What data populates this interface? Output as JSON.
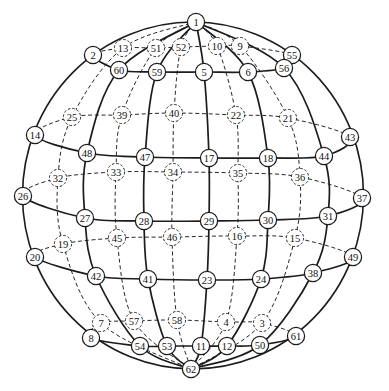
{
  "figure": {
    "type": "sphere-graph",
    "background": "#ffffff",
    "line_color": "#1c1c1c",
    "node_fill": "#ffffff",
    "outer_ellipse": {
      "cx": 193,
      "cy": 195.5,
      "rx": 170.5,
      "ry": 173.5
    },
    "north_pole": "1",
    "south_pole": "62",
    "nodes": [
      {
        "id": "1",
        "label": "1",
        "x": 196,
        "y": 22,
        "side": "front"
      },
      {
        "id": "2",
        "label": "2",
        "x": 93,
        "y": 55,
        "side": "front"
      },
      {
        "id": "3",
        "label": "3",
        "x": 262,
        "y": 323,
        "side": "back"
      },
      {
        "id": "4",
        "label": "4",
        "x": 226,
        "y": 322,
        "side": "back"
      },
      {
        "id": "5",
        "label": "5",
        "x": 204,
        "y": 72,
        "side": "front"
      },
      {
        "id": "6",
        "label": "6",
        "x": 248,
        "y": 72,
        "side": "front"
      },
      {
        "id": "7",
        "label": "7",
        "x": 101,
        "y": 323,
        "side": "back"
      },
      {
        "id": "8",
        "label": "8",
        "x": 91,
        "y": 338,
        "side": "front"
      },
      {
        "id": "9",
        "label": "9",
        "x": 240,
        "y": 46,
        "side": "back"
      },
      {
        "id": "10",
        "label": "10",
        "x": 217,
        "y": 46,
        "side": "back"
      },
      {
        "id": "11",
        "label": "11",
        "x": 201,
        "y": 346,
        "side": "front"
      },
      {
        "id": "12",
        "label": "12",
        "x": 227,
        "y": 346,
        "side": "front"
      },
      {
        "id": "13",
        "label": "13",
        "x": 123,
        "y": 48,
        "side": "back"
      },
      {
        "id": "14",
        "label": "14",
        "x": 35,
        "y": 135,
        "side": "front"
      },
      {
        "id": "15",
        "label": "15",
        "x": 295,
        "y": 238,
        "side": "back"
      },
      {
        "id": "16",
        "label": "16",
        "x": 237,
        "y": 236,
        "side": "back"
      },
      {
        "id": "17",
        "label": "17",
        "x": 209,
        "y": 158,
        "side": "front"
      },
      {
        "id": "18",
        "label": "18",
        "x": 268,
        "y": 158,
        "side": "front"
      },
      {
        "id": "19",
        "label": "19",
        "x": 63,
        "y": 244,
        "side": "back"
      },
      {
        "id": "20",
        "label": "20",
        "x": 35,
        "y": 257,
        "side": "front"
      },
      {
        "id": "21",
        "label": "21",
        "x": 288,
        "y": 118,
        "side": "back"
      },
      {
        "id": "22",
        "label": "22",
        "x": 236,
        "y": 115,
        "side": "back"
      },
      {
        "id": "23",
        "label": "23",
        "x": 207,
        "y": 280,
        "side": "front"
      },
      {
        "id": "24",
        "label": "24",
        "x": 261,
        "y": 279,
        "side": "front"
      },
      {
        "id": "25",
        "label": "25",
        "x": 72,
        "y": 117,
        "side": "back"
      },
      {
        "id": "26",
        "label": "26",
        "x": 23,
        "y": 196,
        "side": "front"
      },
      {
        "id": "27",
        "label": "27",
        "x": 85,
        "y": 218,
        "side": "front"
      },
      {
        "id": "28",
        "label": "28",
        "x": 144,
        "y": 221,
        "side": "front"
      },
      {
        "id": "29",
        "label": "29",
        "x": 209,
        "y": 221,
        "side": "front"
      },
      {
        "id": "30",
        "label": "30",
        "x": 268,
        "y": 220,
        "side": "front"
      },
      {
        "id": "31",
        "label": "31",
        "x": 328,
        "y": 216,
        "side": "front"
      },
      {
        "id": "32",
        "label": "32",
        "x": 58,
        "y": 178,
        "side": "back"
      },
      {
        "id": "33",
        "label": "33",
        "x": 116,
        "y": 172,
        "side": "back"
      },
      {
        "id": "34",
        "label": "34",
        "x": 173,
        "y": 172,
        "side": "back"
      },
      {
        "id": "35",
        "label": "35",
        "x": 238,
        "y": 173,
        "side": "back"
      },
      {
        "id": "36",
        "label": "36",
        "x": 300,
        "y": 177,
        "side": "back"
      },
      {
        "id": "37",
        "label": "37",
        "x": 362,
        "y": 198,
        "side": "front"
      },
      {
        "id": "38",
        "label": "38",
        "x": 313,
        "y": 273,
        "side": "front"
      },
      {
        "id": "39",
        "label": "39",
        "x": 122,
        "y": 115,
        "side": "back"
      },
      {
        "id": "40",
        "label": "40",
        "x": 174,
        "y": 113,
        "side": "back"
      },
      {
        "id": "41",
        "label": "41",
        "x": 148,
        "y": 279,
        "side": "front"
      },
      {
        "id": "42",
        "label": "42",
        "x": 96,
        "y": 276,
        "side": "front"
      },
      {
        "id": "43",
        "label": "43",
        "x": 350,
        "y": 137,
        "side": "front"
      },
      {
        "id": "44",
        "label": "44",
        "x": 324,
        "y": 156,
        "side": "front"
      },
      {
        "id": "45",
        "label": "45",
        "x": 117,
        "y": 238,
        "side": "back"
      },
      {
        "id": "46",
        "label": "46",
        "x": 172,
        "y": 237,
        "side": "back"
      },
      {
        "id": "47",
        "label": "47",
        "x": 145,
        "y": 157,
        "side": "front"
      },
      {
        "id": "48",
        "label": "48",
        "x": 87,
        "y": 153,
        "side": "front"
      },
      {
        "id": "49",
        "label": "49",
        "x": 353,
        "y": 257,
        "side": "front"
      },
      {
        "id": "50",
        "label": "50",
        "x": 260,
        "y": 345,
        "side": "front"
      },
      {
        "id": "51",
        "label": "51",
        "x": 156,
        "y": 48,
        "side": "back"
      },
      {
        "id": "52",
        "label": "52",
        "x": 181,
        "y": 47,
        "side": "back"
      },
      {
        "id": "53",
        "label": "53",
        "x": 167,
        "y": 346,
        "side": "front"
      },
      {
        "id": "54",
        "label": "54",
        "x": 140,
        "y": 346,
        "side": "front"
      },
      {
        "id": "55",
        "label": "55",
        "x": 292,
        "y": 55,
        "side": "front"
      },
      {
        "id": "56",
        "label": "56",
        "x": 284,
        "y": 68,
        "side": "front"
      },
      {
        "id": "57",
        "label": "57",
        "x": 134,
        "y": 321,
        "side": "back"
      },
      {
        "id": "58",
        "label": "58",
        "x": 177,
        "y": 320,
        "side": "back"
      },
      {
        "id": "59",
        "label": "59",
        "x": 157,
        "y": 72,
        "side": "front"
      },
      {
        "id": "60",
        "label": "60",
        "x": 119,
        "y": 70,
        "side": "front"
      },
      {
        "id": "61",
        "label": "61",
        "x": 296,
        "y": 336,
        "side": "front"
      },
      {
        "id": "62",
        "label": "62",
        "x": 191,
        "y": 369,
        "side": "front"
      }
    ],
    "rings": [
      {
        "loop": [
          "2",
          "60",
          "59",
          "5",
          "6",
          "56",
          "55",
          "9",
          "10",
          "52",
          "51",
          "13"
        ],
        "front_nodes": 7
      },
      {
        "loop": [
          "14",
          "48",
          "47",
          "17",
          "18",
          "44",
          "43",
          "21",
          "22",
          "40",
          "39",
          "25"
        ],
        "front_nodes": 7
      },
      {
        "loop": [
          "26",
          "27",
          "28",
          "29",
          "30",
          "31",
          "37",
          "36",
          "35",
          "34",
          "33",
          "32"
        ],
        "front_nodes": 7
      },
      {
        "loop": [
          "20",
          "42",
          "41",
          "23",
          "24",
          "38",
          "49",
          "15",
          "16",
          "46",
          "45",
          "19"
        ],
        "front_nodes": 7
      },
      {
        "loop": [
          "8",
          "54",
          "53",
          "11",
          "12",
          "50",
          "61",
          "3",
          "4",
          "58",
          "57",
          "7"
        ],
        "front_nodes": 7
      }
    ],
    "meridians_front": [
      [
        "1",
        "60",
        "48",
        "27",
        "42",
        "54",
        "62"
      ],
      [
        "1",
        "59",
        "47",
        "28",
        "41",
        "53",
        "62"
      ],
      [
        "1",
        "5",
        "17",
        "29",
        "23",
        "11",
        "62"
      ],
      [
        "1",
        "6",
        "18",
        "30",
        "24",
        "12",
        "62"
      ],
      [
        "1",
        "56",
        "44",
        "31",
        "38",
        "50",
        "62"
      ]
    ],
    "meridians_back": [
      [
        "1",
        "13",
        "25",
        "32",
        "19",
        "7",
        "62"
      ],
      [
        "1",
        "51",
        "39",
        "33",
        "45",
        "57",
        "62"
      ],
      [
        "1",
        "52",
        "40",
        "34",
        "46",
        "58",
        "62"
      ],
      [
        "1",
        "10",
        "22",
        "35",
        "16",
        "4",
        "62"
      ],
      [
        "1",
        "9",
        "21",
        "36",
        "15",
        "3",
        "62"
      ]
    ]
  }
}
